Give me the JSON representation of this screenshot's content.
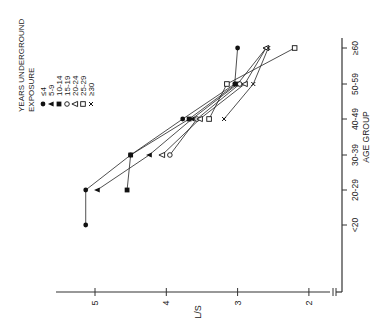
{
  "chart_data": {
    "type": "line",
    "orientation": "rotated-90-ccw",
    "title": "",
    "xlabel": "AGE GROUP",
    "ylabel": "L/S",
    "categories": [
      "<20",
      "20-29",
      "30-39",
      "40-49",
      "50-59",
      "≥60"
    ],
    "ylim": [
      2,
      5.3
    ],
    "yticks": [
      2,
      3,
      4,
      5
    ],
    "legend_title": [
      "YEARS UNDERGROUND",
      "EXPOSURE"
    ],
    "series": [
      {
        "name": "≤4",
        "marker": "filled-circle",
        "values": [
          5.13,
          5.13,
          4.5,
          3.77,
          3.04,
          3.0
        ]
      },
      {
        "name": "5-9",
        "marker": "filled-triangle",
        "values": [
          null,
          4.97,
          4.24,
          3.64,
          3.0,
          2.6
        ]
      },
      {
        "name": "10-14",
        "marker": "filled-square",
        "values": [
          null,
          4.55,
          4.5,
          3.68,
          3.02,
          null
        ]
      },
      {
        "name": "15-19",
        "marker": "open-circle",
        "values": [
          null,
          null,
          3.95,
          3.57,
          2.97,
          null
        ]
      },
      {
        "name": "20-24",
        "marker": "open-triangle",
        "values": [
          null,
          null,
          4.06,
          3.53,
          2.9,
          2.6
        ]
      },
      {
        "name": "25-29",
        "marker": "open-square",
        "values": [
          null,
          null,
          null,
          3.4,
          3.15,
          2.2
        ]
      },
      {
        "name": "≥30",
        "marker": "cross",
        "values": [
          null,
          null,
          null,
          3.19,
          2.78,
          2.57
        ]
      }
    ]
  }
}
